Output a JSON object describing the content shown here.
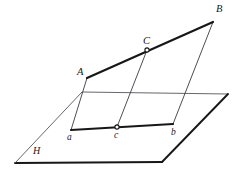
{
  "figure": {
    "type": "geometry-diagram",
    "background_color": "#ffffff",
    "stroke_color": "#17171a",
    "thin_stroke_color": "#3a3a40",
    "labels": {
      "A": "A",
      "B": "B",
      "C": "C",
      "a": "a",
      "b": "b",
      "c": "c",
      "H": "H"
    },
    "points": {
      "A": {
        "x": 87,
        "y": 78
      },
      "B": {
        "x": 213,
        "y": 22
      },
      "C": {
        "x": 147,
        "y": 50
      },
      "a": {
        "x": 71,
        "y": 130
      },
      "b": {
        "x": 173,
        "y": 124
      },
      "c": {
        "x": 117,
        "y": 127
      }
    },
    "plane": {
      "name": "H",
      "corners": [
        {
          "x": 82,
          "y": 92
        },
        {
          "x": 228,
          "y": 94
        },
        {
          "x": 162,
          "y": 162
        },
        {
          "x": 15,
          "y": 163
        }
      ]
    },
    "segments": [
      {
        "name": "AB",
        "from": "A",
        "to": "B",
        "weight": "thick"
      },
      {
        "name": "ab",
        "from": "a",
        "to": "b",
        "weight": "thick"
      },
      {
        "name": "Aa",
        "from": "A",
        "to": "a",
        "weight": "thin"
      },
      {
        "name": "Bb",
        "from": "B",
        "to": "b",
        "weight": "thin"
      },
      {
        "name": "Cc",
        "from": "C",
        "to": "c",
        "weight": "thin"
      }
    ],
    "marked_points": [
      "C",
      "c"
    ]
  }
}
